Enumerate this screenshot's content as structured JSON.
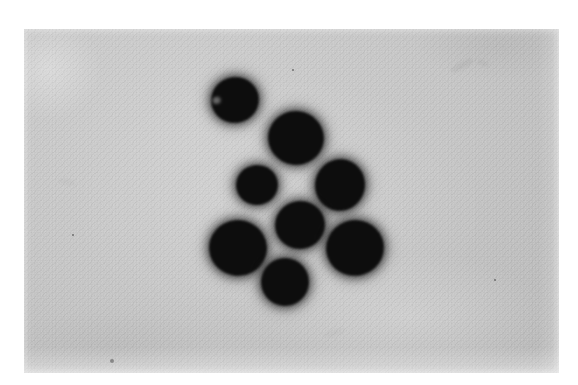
{
  "image": {
    "kind": "photographic-micrograph",
    "subject": "cluster of dark round particles",
    "caption": "",
    "background_color": "#c6c6c6",
    "particle_color": "#0d0d0d",
    "border_color": "#ffffff",
    "photo_area": {
      "left": 24,
      "top": 29,
      "width": 535,
      "height": 344
    },
    "particle_count": 8
  },
  "particles": [
    {
      "id": "particle-1",
      "label": "top-left",
      "cx": 211,
      "cy": 71,
      "rx": 24,
      "ry": 23,
      "rotation": -12,
      "notched": true
    },
    {
      "id": "particle-2",
      "label": "upper-center",
      "cx": 272,
      "cy": 109,
      "rx": 28,
      "ry": 27,
      "rotation": 8,
      "notched": false
    },
    {
      "id": "particle-3",
      "label": "middle-left",
      "cx": 233,
      "cy": 156,
      "rx": 21,
      "ry": 20,
      "rotation": -5,
      "notched": false
    },
    {
      "id": "particle-4",
      "label": "middle-right",
      "cx": 316,
      "cy": 156,
      "rx": 25,
      "ry": 26,
      "rotation": 14,
      "notched": false
    },
    {
      "id": "particle-5",
      "label": "center",
      "cx": 276,
      "cy": 196,
      "rx": 25,
      "ry": 24,
      "rotation": -8,
      "notched": false
    },
    {
      "id": "particle-6",
      "label": "bottom-left",
      "cx": 214,
      "cy": 219,
      "rx": 29,
      "ry": 28,
      "rotation": 6,
      "notched": false
    },
    {
      "id": "particle-7",
      "label": "bottom-right",
      "cx": 331,
      "cy": 219,
      "rx": 29,
      "ry": 28,
      "rotation": -10,
      "notched": false
    },
    {
      "id": "particle-8",
      "label": "bottom-center",
      "cx": 261,
      "cy": 253,
      "rx": 24,
      "ry": 24,
      "rotation": 4,
      "notched": false
    }
  ],
  "artifacts": [
    {
      "id": "smudge-upper-right",
      "left": 425,
      "top": 33,
      "width": 26,
      "height": 7,
      "rotation": -28,
      "opacity": 0.34
    },
    {
      "id": "smudge-upper-right-2",
      "left": 452,
      "top": 31,
      "width": 14,
      "height": 6,
      "rotation": 22,
      "opacity": 0.26
    },
    {
      "id": "smudge-left-mid",
      "left": 34,
      "top": 150,
      "width": 18,
      "height": 6,
      "rotation": 12,
      "opacity": 0.18
    },
    {
      "id": "smudge-lower-mid",
      "left": 300,
      "top": 300,
      "width": 22,
      "height": 7,
      "rotation": -16,
      "opacity": 0.16
    }
  ],
  "specks": [
    {
      "id": "speck-bottom-left",
      "left": 86,
      "top": 330,
      "size": 4
    },
    {
      "id": "speck-mid-left",
      "left": 48,
      "top": 205,
      "size": 2
    },
    {
      "id": "speck-top-mid",
      "left": 268,
      "top": 40,
      "size": 2
    },
    {
      "id": "speck-right",
      "left": 470,
      "top": 250,
      "size": 2
    }
  ]
}
